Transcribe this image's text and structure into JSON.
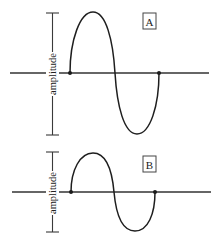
{
  "figure": {
    "panels": [
      {
        "id": "A",
        "label": "A",
        "amplitude_label": "amplitude",
        "description": "larger-amplitude wave"
      },
      {
        "id": "B",
        "label": "B",
        "amplitude_label": "amplitude",
        "description": "smaller-amplitude wave"
      }
    ]
  },
  "colors": {
    "line": "#1e1e1e",
    "background": "#ffffff"
  }
}
